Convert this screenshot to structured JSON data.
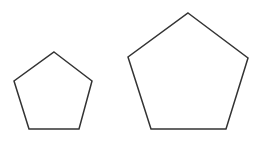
{
  "diagram": {
    "stroke_color": "#333333",
    "background": "#ffffff",
    "shapes": [
      {
        "name": "small-pentagon",
        "points": "54,52 92,81 79,129 29,129 14,81"
      },
      {
        "name": "large-pentagon",
        "points": "188,13 248,58 226,129 151,129 128,57"
      }
    ]
  }
}
